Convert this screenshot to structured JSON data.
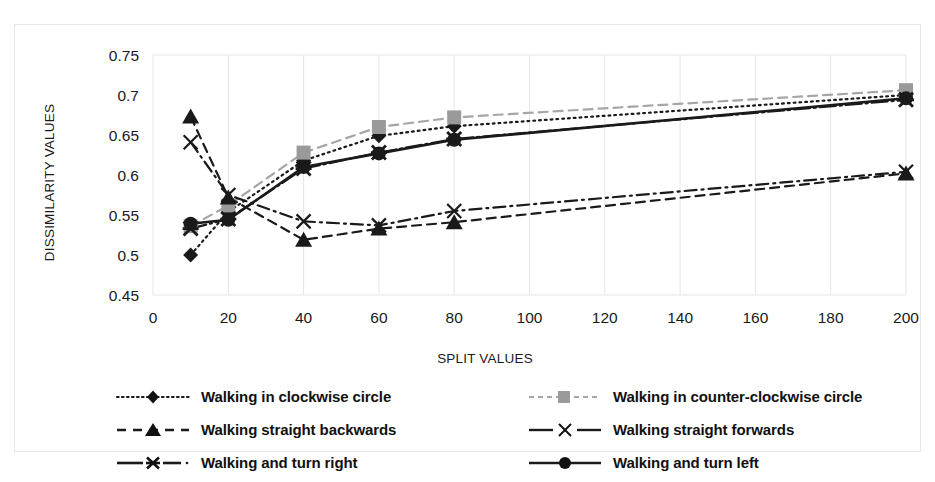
{
  "chart_data": {
    "type": "line",
    "title": "",
    "xlabel": "SPLIT VALUES",
    "ylabel": "DISSIMILARITY VALUES",
    "xlim": [
      0,
      200
    ],
    "ylim": [
      0.45,
      0.75
    ],
    "xticks": [
      0,
      20,
      40,
      60,
      80,
      100,
      120,
      140,
      160,
      180,
      200
    ],
    "xtick_labels": [
      "0",
      "20",
      "40",
      "60",
      "80",
      "100",
      "120",
      "140",
      "160",
      "180",
      "200"
    ],
    "yticks": [
      0.45,
      0.5,
      0.55,
      0.6,
      0.65,
      0.7,
      0.75
    ],
    "ytick_labels": [
      "0.45",
      "0.5",
      "0.55",
      "0.6",
      "0.65",
      "0.7",
      "0.75"
    ],
    "grid": true,
    "grid_color": "#e6e6e6",
    "legend_position": "bottom",
    "x": [
      10,
      20,
      40,
      60,
      80,
      200
    ],
    "series": [
      {
        "name": "Walking in clockwise circle",
        "marker": "diamond",
        "line_style": "dotted",
        "color": "#1a1a1a",
        "values": [
          0.5,
          0.554,
          0.618,
          0.649,
          0.661,
          0.7
        ]
      },
      {
        "name": "Walking in counter-clockwise circle",
        "marker": "square",
        "line_style": "dashed",
        "color": "#a6a6a6",
        "values": [
          0.536,
          0.562,
          0.628,
          0.66,
          0.672,
          0.706
        ]
      },
      {
        "name": "Walking straight backwards",
        "marker": "triangle",
        "line_style": "dashed",
        "color": "#1a1a1a",
        "values": [
          0.673,
          0.572,
          0.519,
          0.533,
          0.541,
          0.602
        ]
      },
      {
        "name": "Walking straight forwards",
        "marker": "x",
        "line_style": "dash-dot",
        "color": "#1a1a1a",
        "values": [
          0.641,
          0.575,
          0.542,
          0.537,
          0.555,
          0.604
        ]
      },
      {
        "name": "Walking and turn right",
        "marker": "asterisk",
        "line_style": "solid-dot",
        "color": "#1a1a1a",
        "values": [
          0.533,
          0.545,
          0.608,
          0.628,
          0.645,
          0.694
        ]
      },
      {
        "name": "Walking and turn left",
        "marker": "circle",
        "line_style": "solid",
        "color": "#1a1a1a",
        "values": [
          0.539,
          0.544,
          0.61,
          0.627,
          0.644,
          0.696
        ]
      }
    ]
  },
  "legend": {
    "items": [
      {
        "label": "Walking in clockwise circle"
      },
      {
        "label": "Walking in counter-clockwise circle"
      },
      {
        "label": "Walking straight backwards"
      },
      {
        "label": "Walking straight forwards"
      },
      {
        "label": "Walking and turn right"
      },
      {
        "label": "Walking and turn left"
      }
    ]
  },
  "axes": {
    "x_title": "SPLIT VALUES",
    "y_title": "DISSIMILARITY VALUES"
  }
}
